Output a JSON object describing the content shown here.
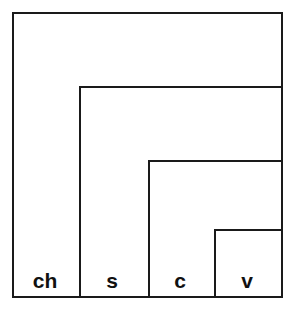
{
  "diagram": {
    "name": "nested-containment-diagram",
    "background_color": "#ffffff",
    "stroke_color": "#1a1a1a",
    "text_color": "#111111",
    "stroke_width": 2,
    "levels": [
      {
        "key": "ch",
        "label": "ch",
        "label_x": 45,
        "label_y": 288,
        "x": 12,
        "y": 12,
        "width": 271,
        "height": 286
      },
      {
        "key": "s",
        "label": "s",
        "label_x": 112,
        "label_y": 288,
        "x": 79,
        "y": 86,
        "width": 204,
        "height": 212
      },
      {
        "key": "c",
        "label": "c",
        "label_x": 180,
        "label_y": 288,
        "x": 148,
        "y": 160,
        "width": 135,
        "height": 138
      },
      {
        "key": "v",
        "label": "v",
        "label_x": 247,
        "label_y": 288,
        "x": 214,
        "y": 229,
        "width": 69,
        "height": 69
      }
    ]
  }
}
